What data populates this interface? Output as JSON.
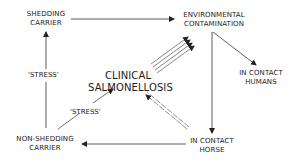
{
  "diagram": {
    "nodes": {
      "shedding_carrier": [
        "SHEDDING",
        "CARRIER"
      ],
      "environmental_contamination": [
        "ENVIRONMENTAL",
        "CONTAMINATION"
      ],
      "clinical_salmonellosis": [
        "CLINICAL",
        "SALMONELLOSIS"
      ],
      "in_contact_humans": [
        "IN CONTACT",
        "HUMANS"
      ],
      "non_shedding_carrier": [
        "NON-SHEDDING",
        "CARRIER"
      ],
      "in_contact_horse": [
        "IN CONTACT",
        "HORSE"
      ]
    },
    "edge_labels": {
      "stress_left": "'STRESS'",
      "stress_diagonal": "'STRESS'"
    },
    "edges": [
      {
        "from": "shedding_carrier",
        "to": "environmental_contamination",
        "style": "single"
      },
      {
        "from": "clinical_salmonellosis",
        "to": "environmental_contamination",
        "style": "quadruple"
      },
      {
        "from": "environmental_contamination",
        "to": "in_contact_humans",
        "style": "single"
      },
      {
        "from": "environmental_contamination",
        "to": "in_contact_horse",
        "style": "single"
      },
      {
        "from": "in_contact_horse",
        "to": "clinical_salmonellosis",
        "style": "double-dashed"
      },
      {
        "from": "in_contact_horse",
        "to": "non_shedding_carrier",
        "style": "single"
      },
      {
        "from": "non_shedding_carrier",
        "to": "shedding_carrier",
        "style": "single",
        "label": "'STRESS'"
      },
      {
        "from": "non_shedding_carrier",
        "to": "clinical_salmonellosis",
        "style": "single",
        "label": "'STRESS'"
      }
    ]
  }
}
